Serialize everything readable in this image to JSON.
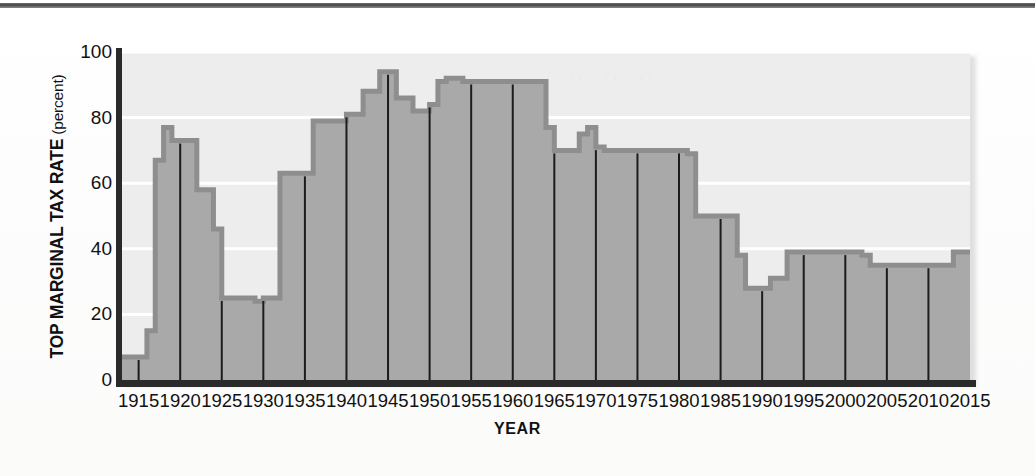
{
  "figure": {
    "ylabel_main": "TOP MARGINAL TAX RATE",
    "ylabel_paren": " (percent)",
    "xlabel": "YEAR"
  },
  "colors": {
    "area_fill": "#a9a9a9",
    "area_stroke": "#8e8e8e",
    "plot_background": "#ededed",
    "gridline": "#ffffff",
    "tick_line": "#1c1c1c",
    "axis": "#2a2a2a",
    "text": "#111111"
  },
  "chart_data": {
    "type": "area",
    "title": "",
    "subtitle": "",
    "xlabel": "YEAR",
    "ylabel": "TOP MARGINAL TAX RATE (percent)",
    "xlim": [
      1913,
      2015
    ],
    "ylim": [
      0,
      100
    ],
    "xticks": [
      1915,
      1920,
      1925,
      1930,
      1935,
      1940,
      1945,
      1950,
      1955,
      1960,
      1965,
      1970,
      1975,
      1980,
      1985,
      1990,
      1995,
      2000,
      2005,
      2010,
      2015
    ],
    "yticks": [
      0,
      20,
      40,
      60,
      80,
      100
    ],
    "grid": "horizontal",
    "legend": "none",
    "step": "post",
    "series": [
      {
        "name": "Top marginal tax rate",
        "x": [
          1913,
          1916,
          1917,
          1918,
          1919,
          1922,
          1924,
          1925,
          1929,
          1930,
          1932,
          1936,
          1940,
          1941,
          1942,
          1944,
          1946,
          1948,
          1950,
          1951,
          1952,
          1954,
          1964,
          1965,
          1968,
          1969,
          1970,
          1971,
          1981,
          1982,
          1987,
          1988,
          1991,
          1993,
          2001,
          2002,
          2003,
          2013
        ],
        "values": [
          7,
          15,
          67,
          77,
          73,
          58,
          46,
          25,
          24,
          25,
          63,
          79,
          81,
          81,
          88,
          94,
          86,
          82,
          84,
          91,
          92,
          91,
          77,
          70,
          75,
          77,
          71,
          70,
          69,
          50,
          38,
          28,
          31,
          39,
          39,
          38,
          35,
          39
        ]
      }
    ]
  }
}
